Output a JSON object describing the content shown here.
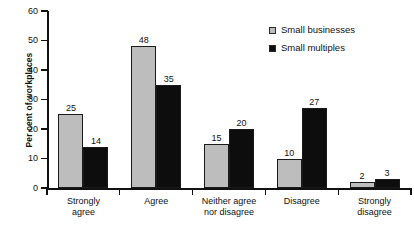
{
  "chart_data": {
    "type": "bar",
    "title": "",
    "xlabel": "",
    "ylabel": "Per cent of workplaces",
    "ylim": [
      0,
      60
    ],
    "yticks": [
      0,
      10,
      20,
      30,
      40,
      50,
      60
    ],
    "grid": false,
    "legend_position": "top-right",
    "categories": [
      "Strongly\nagree",
      "Agree",
      "Neither agree\nnor disagree",
      "Disagree",
      "Strongly\ndisagree"
    ],
    "series": [
      {
        "name": "Small businesses",
        "color": "#bdbdbd",
        "values": [
          25,
          48,
          15,
          10,
          2
        ]
      },
      {
        "name": "Small multiples",
        "color": "#0d0d0d",
        "values": [
          14,
          35,
          20,
          27,
          3
        ]
      }
    ]
  }
}
